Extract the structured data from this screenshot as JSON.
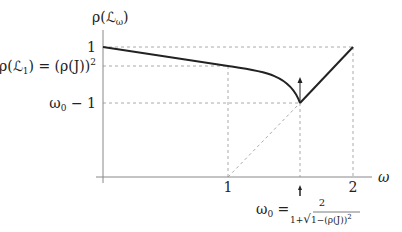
{
  "diagram": {
    "y_axis_label": "ρ(ℒ",
    "y_axis_label_sub": "ω",
    "y_axis_label_close": ")",
    "x_axis_label": "ω",
    "y_ticks": {
      "one": "1",
      "rho_L1": "ρ(ℒ",
      "rho_L1_sub": "1",
      "rho_L1_rest": ") = (ρ(J))",
      "rho_L1_sup": "2",
      "omega0_minus1": "ω",
      "omega0_minus1_sub": "0",
      "omega0_minus1_rest": " − 1"
    },
    "x_ticks": {
      "one": "1",
      "two": "2"
    },
    "formula": {
      "lhs": "ω",
      "lhs_sub": "0",
      "eq": " =",
      "numerator": "2",
      "denominator_prefix": "1+",
      "sqrt_sign": "√",
      "denominator_radicand": "1−(ρ(J))",
      "denominator_sup": "2"
    },
    "colors": {
      "curve": "#222222",
      "axis": "#888888",
      "guide": "#aaaaaa"
    }
  }
}
